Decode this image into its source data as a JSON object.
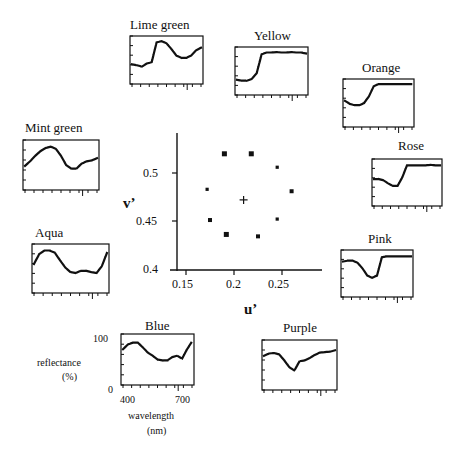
{
  "chart_data": {
    "type": "scatter",
    "title": "",
    "xlabel": "u'",
    "ylabel": "v'",
    "xlim": [
      0.14,
      0.29
    ],
    "ylim": [
      0.4,
      0.54
    ],
    "xticks": [
      "0.15",
      "0.2",
      "0.25"
    ],
    "yticks": [
      "0.4",
      "0.45",
      "0.5"
    ],
    "grid": false,
    "points": [
      {
        "u": 0.19,
        "v": 0.52,
        "size": "large"
      },
      {
        "u": 0.218,
        "v": 0.52,
        "size": "large"
      },
      {
        "u": 0.245,
        "v": 0.506,
        "size": "small"
      },
      {
        "u": 0.172,
        "v": 0.483,
        "size": "small"
      },
      {
        "u": 0.26,
        "v": 0.481,
        "size": "medium"
      },
      {
        "u": 0.175,
        "v": 0.451,
        "size": "medium"
      },
      {
        "u": 0.245,
        "v": 0.452,
        "size": "small"
      },
      {
        "u": 0.192,
        "v": 0.436,
        "size": "large"
      },
      {
        "u": 0.225,
        "v": 0.434,
        "size": "medium"
      }
    ],
    "white_point": {
      "u": 0.21,
      "v": 0.472,
      "marker": "+"
    },
    "reflectance_spectra": {
      "xlabel": "wavelength (nm)",
      "ylabel": "reflectance (%)",
      "x_ticks": [
        "400",
        "700"
      ],
      "y_ticks": [
        "0",
        "100"
      ],
      "wavelength_range": [
        390,
        780
      ],
      "series": [
        {
          "name": "Lime green",
          "values": [
            40,
            38,
            35,
            42,
            45,
            90,
            93,
            88,
            75,
            60,
            55,
            55,
            60,
            72,
            78
          ]
        },
        {
          "name": "Yellow",
          "values": [
            30,
            28,
            28,
            32,
            45,
            88,
            92,
            92,
            93,
            92,
            92,
            93,
            92,
            92,
            90
          ]
        },
        {
          "name": "Orange",
          "values": [
            55,
            48,
            45,
            45,
            50,
            65,
            88,
            93,
            93,
            93,
            93,
            93,
            93,
            93,
            93
          ]
        },
        {
          "name": "Rose",
          "values": [
            58,
            58,
            55,
            48,
            42,
            42,
            62,
            90,
            90,
            90,
            90,
            90,
            91,
            90,
            90
          ]
        },
        {
          "name": "Pink",
          "values": [
            78,
            80,
            80,
            75,
            62,
            45,
            40,
            45,
            88,
            90,
            90,
            90,
            90,
            90,
            90
          ]
        },
        {
          "name": "Purple",
          "values": [
            70,
            75,
            76,
            73,
            60,
            45,
            38,
            58,
            60,
            65,
            72,
            77,
            78,
            79,
            82
          ]
        },
        {
          "name": "Blue",
          "values": [
            72,
            82,
            86,
            86,
            76,
            65,
            58,
            50,
            48,
            48,
            55,
            58,
            52,
            72,
            88
          ]
        },
        {
          "name": "Aqua",
          "values": [
            60,
            82,
            90,
            90,
            85,
            68,
            52,
            42,
            40,
            45,
            45,
            42,
            40,
            55,
            85
          ]
        },
        {
          "name": "Mint green",
          "values": [
            48,
            58,
            70,
            80,
            87,
            90,
            85,
            70,
            50,
            42,
            42,
            53,
            58,
            60,
            65
          ]
        }
      ]
    }
  },
  "labels": {
    "lime_green": "Lime green",
    "yellow": "Yellow",
    "orange": "Orange",
    "rose": "Rose",
    "pink": "Pink",
    "purple": "Purple",
    "blue": "Blue",
    "aqua": "Aqua",
    "mint_green": "Mint green",
    "u_axis": "u’",
    "v_axis": "v’",
    "reflectance": "reflectance",
    "reflectance_unit": "(%)",
    "wavelength": "wavelength",
    "wavelength_unit": "(nm)",
    "y100": "100",
    "y0": "0",
    "x400": "400",
    "x700": "700",
    "xt1": "0.15",
    "xt2": "0.2",
    "xt3": "0.25",
    "yt1": "0.5",
    "yt2": "0.45",
    "yt3": "0.4"
  }
}
